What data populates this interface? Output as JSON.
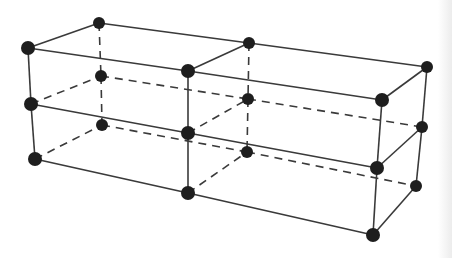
{
  "diagram": {
    "title": "",
    "colors": {
      "background": "#ffffff",
      "edge": "#3a3a3a",
      "node": "#1e1e1e"
    },
    "node_radius": 7,
    "nodes": [
      {
        "id": "F-T-0",
        "x": 28,
        "y": 48
      },
      {
        "id": "F-T-1",
        "x": 188,
        "y": 71
      },
      {
        "id": "F-T-2",
        "x": 382,
        "y": 100
      },
      {
        "id": "F-M-0",
        "x": 31,
        "y": 104
      },
      {
        "id": "F-M-1",
        "x": 188,
        "y": 133
      },
      {
        "id": "F-M-2",
        "x": 377,
        "y": 168
      },
      {
        "id": "F-B-0",
        "x": 35,
        "y": 159
      },
      {
        "id": "F-B-1",
        "x": 188,
        "y": 193
      },
      {
        "id": "F-B-2",
        "x": 373,
        "y": 235
      },
      {
        "id": "K-T-0",
        "x": 99,
        "y": 23
      },
      {
        "id": "K-T-1",
        "x": 249,
        "y": 43
      },
      {
        "id": "K-T-2",
        "x": 427,
        "y": 67
      },
      {
        "id": "K-M-0",
        "x": 101,
        "y": 76
      },
      {
        "id": "K-M-1",
        "x": 248,
        "y": 99
      },
      {
        "id": "K-M-2",
        "x": 422,
        "y": 127
      },
      {
        "id": "K-B-0",
        "x": 102,
        "y": 125
      },
      {
        "id": "K-B-1",
        "x": 247,
        "y": 152
      },
      {
        "id": "K-B-2",
        "x": 416,
        "y": 186
      }
    ],
    "edges_solid": [
      [
        "F-T-0",
        "F-T-1"
      ],
      [
        "F-T-1",
        "F-T-2"
      ],
      [
        "F-M-0",
        "F-M-1"
      ],
      [
        "F-M-1",
        "F-M-2"
      ],
      [
        "F-B-0",
        "F-B-1"
      ],
      [
        "F-B-1",
        "F-B-2"
      ],
      [
        "F-T-0",
        "F-M-0"
      ],
      [
        "F-M-0",
        "F-B-0"
      ],
      [
        "F-T-1",
        "F-M-1"
      ],
      [
        "F-M-1",
        "F-B-1"
      ],
      [
        "F-T-2",
        "F-M-2"
      ],
      [
        "F-M-2",
        "F-B-2"
      ],
      [
        "K-T-0",
        "K-T-1"
      ],
      [
        "K-T-1",
        "K-T-2"
      ],
      [
        "F-T-0",
        "K-T-0"
      ],
      [
        "F-T-1",
        "K-T-1"
      ],
      [
        "F-T-2",
        "K-T-2"
      ],
      [
        "K-T-2",
        "K-M-2"
      ],
      [
        "K-M-2",
        "K-B-2"
      ],
      [
        "F-M-2",
        "K-M-2"
      ],
      [
        "F-B-2",
        "K-B-2"
      ]
    ],
    "edges_dashed": [
      [
        "K-M-0",
        "K-M-1"
      ],
      [
        "K-M-1",
        "K-M-2"
      ],
      [
        "K-B-0",
        "K-B-1"
      ],
      [
        "K-B-1",
        "K-B-2"
      ],
      [
        "K-T-0",
        "K-M-0"
      ],
      [
        "K-M-0",
        "K-B-0"
      ],
      [
        "K-T-1",
        "K-M-1"
      ],
      [
        "K-M-1",
        "K-B-1"
      ],
      [
        "F-M-0",
        "K-M-0"
      ],
      [
        "F-B-0",
        "K-B-0"
      ],
      [
        "F-M-1",
        "K-M-1"
      ],
      [
        "F-B-1",
        "K-B-1"
      ]
    ]
  }
}
